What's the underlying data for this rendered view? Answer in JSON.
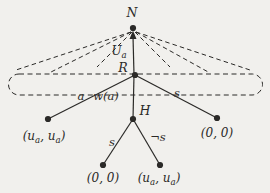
{
  "figure": {
    "background_color": "#f1f0ed",
    "ink_color": "#2b2a28",
    "width": 270,
    "height": 193,
    "nodes": [
      {
        "id": "node-N",
        "x": 133,
        "y": 28,
        "r": 3.1
      },
      {
        "id": "node-R",
        "x": 135,
        "y": 75,
        "r": 3.1
      },
      {
        "id": "node-H",
        "x": 133,
        "y": 119,
        "r": 3.1
      },
      {
        "id": "leaf-R-left",
        "x": 48,
        "y": 119,
        "r": 3.1
      },
      {
        "id": "leaf-R-right",
        "x": 217,
        "y": 118,
        "r": 3.1
      },
      {
        "id": "leaf-H-left",
        "x": 103,
        "y": 165,
        "r": 3.1
      },
      {
        "id": "leaf-H-right",
        "x": 160,
        "y": 165,
        "r": 3.1
      }
    ],
    "solid_edges": [
      {
        "id": "edge-R-to-left-leaf",
        "from": [
          135,
          75
        ],
        "to": [
          48,
          119
        ]
      },
      {
        "id": "edge-R-to-H",
        "from": [
          134,
          75
        ],
        "to": [
          133,
          119
        ]
      },
      {
        "id": "edge-R-to-right-leaf",
        "from": [
          135,
          75
        ],
        "to": [
          217,
          118
        ]
      },
      {
        "id": "edge-H-to-left-leaf",
        "from": [
          133,
          119
        ],
        "to": [
          103,
          165
        ]
      },
      {
        "id": "edge-H-to-right-leaf",
        "from": [
          133,
          119
        ],
        "to": [
          160,
          165
        ]
      }
    ],
    "arrow_edge": {
      "id": "edge-R-to-N-arrow",
      "from": [
        134,
        75
      ],
      "to": [
        133,
        36
      ],
      "head": "133,30.5 129.5,39 136.5,39"
    },
    "dashed_rays": [
      {
        "id": "nature-ray-left-outer",
        "from": [
          131,
          32
        ],
        "to": [
          16,
          70
        ]
      },
      {
        "id": "nature-ray-left-mid",
        "from": [
          131,
          32
        ],
        "to": [
          49,
          73
        ]
      },
      {
        "id": "nature-ray-left-inner",
        "from": [
          132,
          32
        ],
        "to": [
          97,
          67
        ]
      },
      {
        "id": "nature-ray-right-inner",
        "from": [
          135,
          32
        ],
        "to": [
          170,
          67
        ]
      },
      {
        "id": "nature-ray-right-mid",
        "from": [
          136,
          32
        ],
        "to": [
          210,
          73
        ]
      },
      {
        "id": "nature-ray-right-outer",
        "from": [
          136,
          32
        ],
        "to": [
          250,
          70
        ]
      }
    ],
    "information_set": {
      "id": "information-set-outline",
      "x": 8.5,
      "y": 74,
      "width": 254,
      "height": 21,
      "radius": 10.5
    },
    "labels": [
      {
        "id": "label-node-N",
        "text": "N",
        "x": 132,
        "y": 17,
        "size": 12.5
      },
      {
        "id": "label-edge-Ua",
        "text": "U_a",
        "x": 119,
        "y": 55,
        "size": 12
      },
      {
        "id": "label-node-R",
        "text": "R",
        "x": 123,
        "y": 72,
        "size": 12.5
      },
      {
        "id": "label-edge-a",
        "text": "a",
        "x": 81,
        "y": 100,
        "size": 11.5
      },
      {
        "id": "label-edge-wa",
        "text": "w(a)",
        "x": 106,
        "y": 100,
        "size": 11.5
      },
      {
        "id": "label-edge-s-right",
        "text": "s",
        "x": 177,
        "y": 97,
        "size": 11.5
      },
      {
        "id": "label-node-H",
        "text": "H",
        "x": 145,
        "y": 115,
        "size": 12.5
      },
      {
        "id": "label-payoff-R-left",
        "text": "(u_a, u_a)",
        "x": 44,
        "y": 140,
        "size": 12
      },
      {
        "id": "label-payoff-R-right",
        "text": "(0, 0)",
        "x": 217,
        "y": 137,
        "size": 12
      },
      {
        "id": "label-edge-s-H",
        "text": "s",
        "x": 112,
        "y": 146,
        "size": 11.5
      },
      {
        "id": "label-edge-not-s",
        "text": "¬s",
        "x": 158,
        "y": 141,
        "size": 11.5
      },
      {
        "id": "label-payoff-H-left",
        "text": "(0, 0)",
        "x": 103,
        "y": 182,
        "size": 12
      },
      {
        "id": "label-payoff-H-right",
        "text": "(u_a, u_a)",
        "x": 159,
        "y": 182,
        "size": 12
      }
    ]
  }
}
